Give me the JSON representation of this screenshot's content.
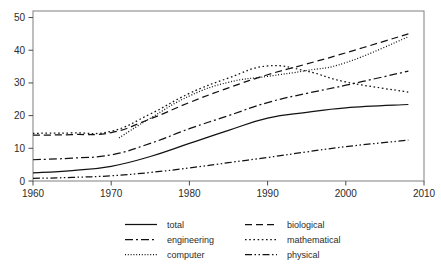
{
  "chart_data": {
    "type": "line",
    "title": "",
    "subtitle": "",
    "xlabel": "",
    "ylabel": "",
    "xlim": [
      1960,
      2010
    ],
    "ylim": [
      0,
      52
    ],
    "xticks": [
      1960,
      1970,
      1980,
      1990,
      2000,
      2010
    ],
    "yticks": [
      0,
      10,
      20,
      30,
      40,
      50
    ],
    "grid": false,
    "legend_position": "bottom",
    "legend_columns": 2,
    "series": [
      {
        "name": "total",
        "label": "total",
        "style": "solid",
        "dasharray": "none",
        "color": "#111111",
        "x": [
          1960,
          1965,
          1970,
          1975,
          1980,
          1985,
          1990,
          1995,
          2000,
          2008
        ],
        "values": [
          2.5,
          3.2,
          4.5,
          7.5,
          11.5,
          15.5,
          19.2,
          21.0,
          22.4,
          23.4
        ]
      },
      {
        "name": "biological",
        "label": "biological",
        "style": "dashed",
        "dasharray": "7,4",
        "color": "#111111",
        "x": [
          1960,
          1965,
          1970,
          1975,
          1980,
          1985,
          1990,
          1995,
          2000,
          2008
        ],
        "values": [
          14.0,
          14.2,
          14.8,
          19.0,
          24.0,
          28.5,
          32.5,
          35.8,
          39.2,
          45.0
        ]
      },
      {
        "name": "engineering",
        "label": "engineering",
        "style": "dashdot",
        "dasharray": "8,3,2,3",
        "color": "#111111",
        "x": [
          1960,
          1965,
          1970,
          1975,
          1980,
          1985,
          1990,
          1995,
          2000,
          2008
        ],
        "values": [
          6.5,
          7.0,
          8.0,
          11.5,
          16.0,
          20.0,
          24.0,
          26.8,
          29.3,
          33.6
        ]
      },
      {
        "name": "mathematical",
        "label": "mathematical",
        "style": "dotted-coarse",
        "dasharray": "1.6,2.6",
        "color": "#111111",
        "x": [
          1960,
          1965,
          1970,
          1975,
          1980,
          1985,
          1990,
          1995,
          2000,
          2008
        ],
        "values": [
          14.6,
          14.7,
          15.2,
          20.5,
          26.8,
          31.5,
          35.2,
          33.6,
          30.3,
          27.2
        ]
      },
      {
        "name": "computer",
        "label": "computer",
        "style": "dotted-fine",
        "dasharray": "1,1.8",
        "color": "#111111",
        "x": [
          1971,
          1975,
          1980,
          1985,
          1990,
          1995,
          2000,
          2008
        ],
        "values": [
          13.2,
          19.2,
          26.0,
          30.2,
          32.0,
          33.8,
          36.2,
          44.1
        ]
      },
      {
        "name": "physical",
        "label": "physical",
        "style": "dashdotdot",
        "dasharray": "7,2.5,1.5,2.5,1.5,2.5",
        "color": "#111111",
        "x": [
          1960,
          1965,
          1970,
          1975,
          1980,
          1985,
          1990,
          1995,
          2000,
          2008
        ],
        "values": [
          0.8,
          1.1,
          1.6,
          2.6,
          4.0,
          5.6,
          7.2,
          8.9,
          10.5,
          12.5
        ]
      }
    ]
  },
  "legend": {
    "entries": [
      {
        "label": "total",
        "series": "total"
      },
      {
        "label": "biological",
        "series": "biological"
      },
      {
        "label": "engineering",
        "series": "engineering"
      },
      {
        "label": "mathematical",
        "series": "mathematical"
      },
      {
        "label": "computer",
        "series": "computer"
      },
      {
        "label": "physical",
        "series": "physical"
      }
    ]
  },
  "colors": {
    "ink": "#111111",
    "frame": "#8a8a8a",
    "tick": "#4a4a4a",
    "text": "#2b2b2b",
    "background": "#ffffff"
  }
}
